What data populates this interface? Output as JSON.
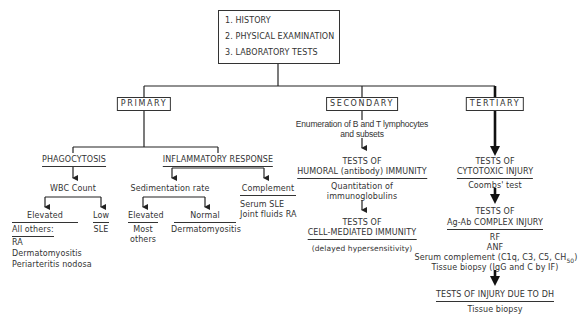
{
  "top_box": {
    "items": [
      "1. HISTORY",
      "2. PHYSICAL EXAMINATION",
      "3. LABORATORY TESTS"
    ]
  },
  "stages": {
    "primary": "PRIMARY",
    "secondary": "SECONDARY",
    "tertiary": "TERTIARY"
  },
  "primary": {
    "phagocytosis": {
      "title": "PHAGOCYTOSIS",
      "test": "WBC Count",
      "elevated": {
        "label": "Elevated",
        "heading": "All others:",
        "items": [
          "RA",
          "Dermatomyositis",
          "Periarteritis nodosa"
        ]
      },
      "low": {
        "label": "Low",
        "items": [
          "SLE"
        ]
      }
    },
    "inflammatory": {
      "title": "INFLAMMATORY RESPONSE",
      "sedimentation": {
        "test": "Sedimentation rate",
        "elevated": {
          "label": "Elevated",
          "items": [
            "Most",
            "others"
          ]
        },
        "normal": {
          "label": "Normal",
          "items": [
            "Dermatomyositis"
          ]
        }
      },
      "complement": {
        "label": "Complement",
        "items": [
          "Serum SLE",
          "Joint fluids RA"
        ]
      }
    }
  },
  "secondary": {
    "enumeration": [
      "Enumeration of B and T lymphocytes",
      "and subsets"
    ],
    "humoral": {
      "line1": "TESTS OF",
      "line2": "HUMORAL (antibody) IMMUNITY",
      "items": [
        "Quantitation of",
        "immunoglobulins"
      ]
    },
    "cell_mediated": {
      "line1": "TESTS OF",
      "line2": "CELL-MEDIATED IMMUNITY",
      "note": "(delayed hypersensitivity)"
    }
  },
  "tertiary": {
    "cytotoxic": {
      "line1": "TESTS OF",
      "line2": "CYTOTOXIC INJURY",
      "items": [
        "Coombs' test"
      ]
    },
    "complex": {
      "line1": "TESTS OF",
      "line2": "Ag-Ab COMPLEX INJURY",
      "items": [
        "RF",
        "ANF",
        "Serum complement (C1q, C3, C5, CH",
        "Tissue biopsy (IgG and C by IF)"
      ],
      "subscript": "50",
      "close_paren": ")"
    },
    "dh": {
      "title": "TESTS OF INJURY DUE TO DH",
      "items": [
        "Tissue biopsy"
      ]
    }
  }
}
